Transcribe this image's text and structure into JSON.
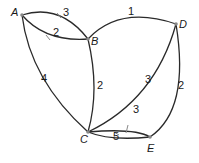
{
  "graph": {
    "vertices": [
      {
        "id": "A",
        "label": "A"
      },
      {
        "id": "B",
        "label": "B"
      },
      {
        "id": "C",
        "label": "C"
      },
      {
        "id": "D",
        "label": "D"
      },
      {
        "id": "E",
        "label": "E"
      }
    ],
    "edges": [
      {
        "from": "A",
        "to": "B",
        "weight": "3",
        "directed": true
      },
      {
        "from": "B",
        "to": "A",
        "weight": "2",
        "directed": true
      },
      {
        "from": "A",
        "to": "C",
        "weight": "4",
        "directed": false
      },
      {
        "from": "B",
        "to": "C",
        "weight": "2",
        "directed": false
      },
      {
        "from": "B",
        "to": "D",
        "weight": "1",
        "directed": false
      },
      {
        "from": "C",
        "to": "D",
        "weight": "3",
        "directed": false
      },
      {
        "from": "D",
        "to": "E",
        "weight": "2",
        "directed": false
      },
      {
        "from": "C",
        "to": "E",
        "weight": "3",
        "directed": true
      },
      {
        "from": "E",
        "to": "C",
        "weight": "5",
        "directed": true
      }
    ]
  }
}
